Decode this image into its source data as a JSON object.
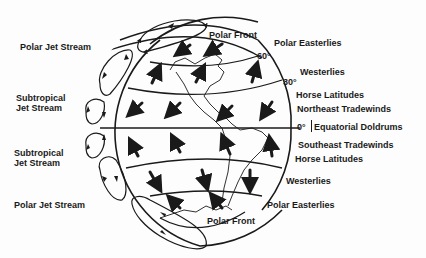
{
  "diagram": {
    "left_labels": {
      "polar_jet_top": "Polar Jet Stream",
      "subtropical_top_1": "Subtropical",
      "subtropical_top_2": "Jet Stream",
      "subtropical_bottom_1": "Subtropical",
      "subtropical_bottom_2": "Jet Stream",
      "polar_jet_bottom": "Polar Jet Stream"
    },
    "right_labels": {
      "polar_front_top": "Polar Front",
      "polar_easterlies_top": "Polar Easterlies",
      "lat_60": "60°",
      "westerlies_top": "Westerlies",
      "lat_30": "30°",
      "horse_latitudes_top": "Horse Latitudes",
      "northeast_tradewinds": "Northeast Tradewinds",
      "lat_0": "0°",
      "equatorial_doldrums": "Equatorial Doldrums",
      "southeast_tradewinds": "Southeast Tradewinds",
      "horse_latitudes_bottom": "Horse Latitudes",
      "westerlies_bottom": "Westerlies",
      "polar_easterlies_bottom": "Polar Easterlies",
      "polar_front_bottom": "Polar Front"
    },
    "colors": {
      "ink": "#1a1a1a",
      "background": "#fdfdfd"
    }
  }
}
